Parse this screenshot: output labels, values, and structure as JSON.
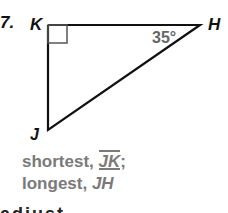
{
  "problem": {
    "number": "7.",
    "vertices": {
      "K": "K",
      "H": "H",
      "J": "J"
    },
    "angle_label": "35°",
    "right_angle_at": "K"
  },
  "answer": {
    "line1_prefix": "shortest, ",
    "line1_segment": "JK",
    "line1_suffix": ";",
    "line2_prefix": "longest, ",
    "line2_segment": "JH"
  },
  "cut_text": "adjust"
}
